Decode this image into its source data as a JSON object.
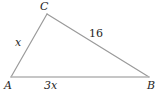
{
  "figure": {
    "kind": "triangle-diagram",
    "background_color": "#ffffff",
    "stroke_color": "#9a9a9a",
    "label_color": "#262626"
  },
  "vertices": [
    {
      "name": "C",
      "label": "C",
      "x": 47,
      "y": 14
    },
    {
      "name": "A",
      "label": "A",
      "x": 11,
      "y": 77
    },
    {
      "name": "B",
      "label": "B",
      "x": 149,
      "y": 77
    }
  ],
  "sides": [
    {
      "name": "AC",
      "label": "x",
      "from": "A",
      "to": "C"
    },
    {
      "name": "CB",
      "label": "16",
      "from": "C",
      "to": "B"
    },
    {
      "name": "AB",
      "label": "3x",
      "from": "A",
      "to": "B"
    }
  ],
  "labels": {
    "vertex_c": "C",
    "vertex_a": "A",
    "vertex_b": "B",
    "side_ac": "x",
    "side_cb": "16",
    "side_ab": "3x"
  }
}
